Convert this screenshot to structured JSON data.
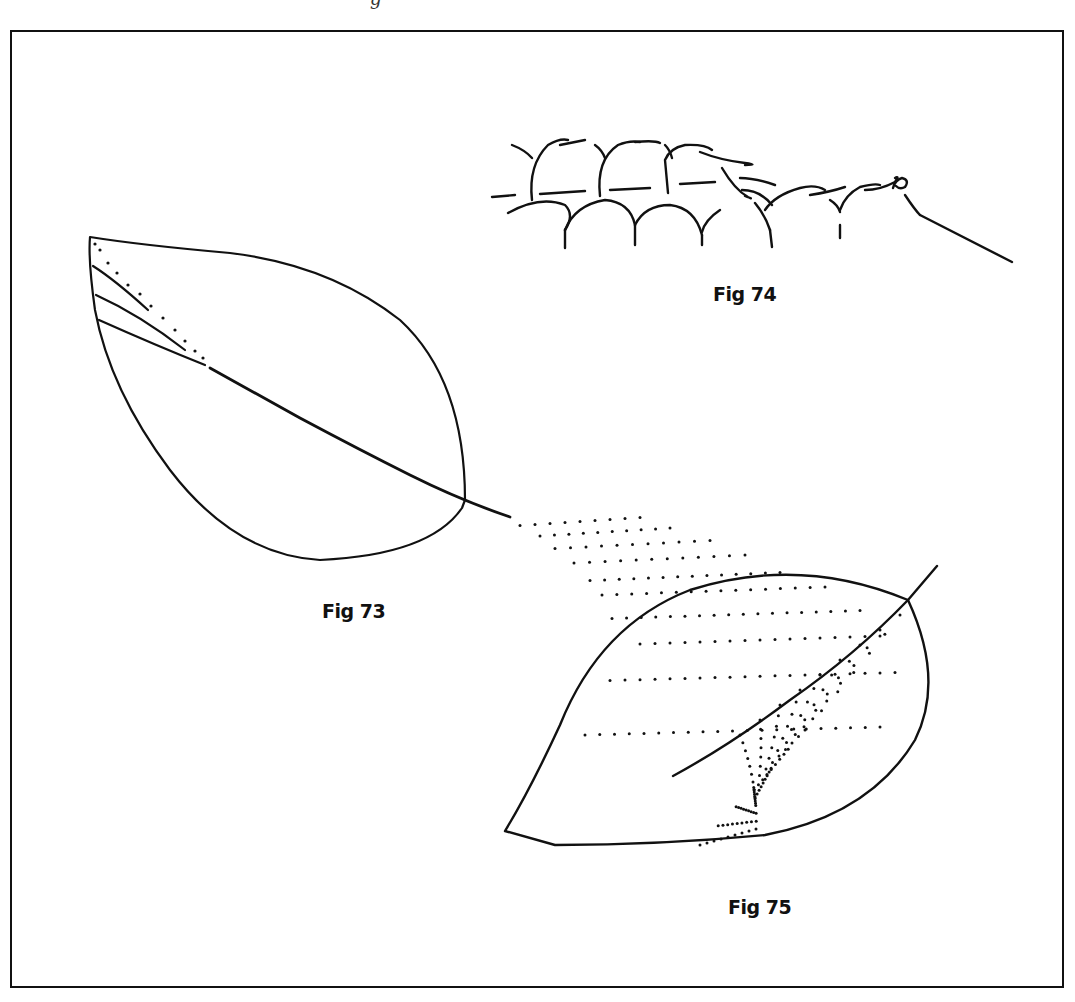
{
  "page": {
    "header_cut_text": "g",
    "figures": [
      {
        "id": "fig73",
        "caption": "Fig 73",
        "subject": "leaf-outline-with-partial-veins"
      },
      {
        "id": "fig74",
        "caption": "Fig 74",
        "subject": "looped-chain-stitch-pattern"
      },
      {
        "id": "fig75",
        "caption": "Fig 75",
        "subject": "leaf-with-dotted-veins"
      }
    ]
  },
  "colors": {
    "ink": "#111111",
    "paper": "#ffffff"
  }
}
